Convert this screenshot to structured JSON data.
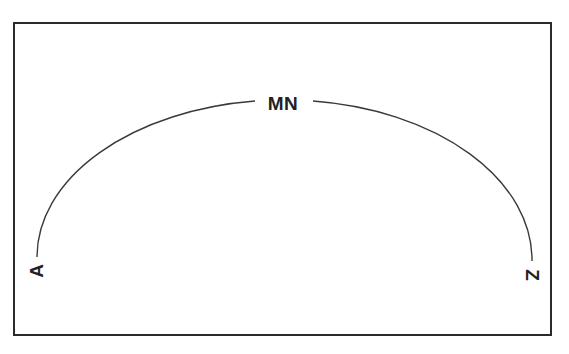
{
  "diagram": {
    "type": "arc-scale",
    "labels": {
      "top": "MN",
      "left": "A",
      "right": "Z"
    },
    "colors": {
      "stroke": "#2b2b2b",
      "text": "#222222",
      "background": "#ffffff"
    }
  }
}
